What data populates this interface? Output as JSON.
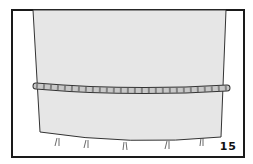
{
  "illustration": {
    "subject": "fabric tube with braided cord tied around it",
    "step_number": "15",
    "colors": {
      "border": "#1a1a1a",
      "fabric": "#e6e6e6",
      "braid": "#c8c8c8",
      "background": "#ffffff"
    }
  }
}
